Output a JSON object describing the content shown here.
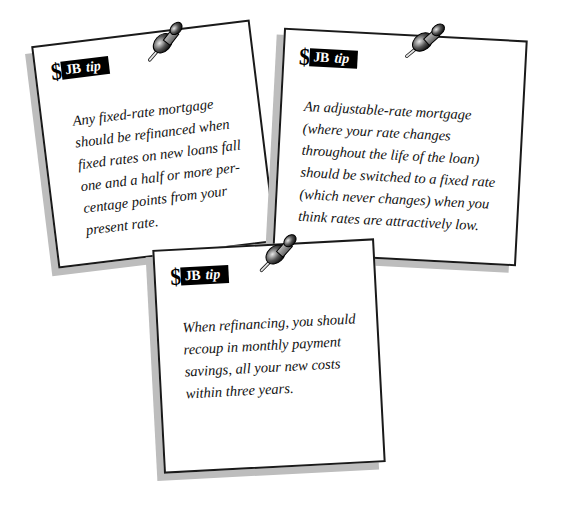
{
  "notes": [
    {
      "badge": {
        "symbol": "$",
        "brand": "JB",
        "label": "tip"
      },
      "text": "Any fixed-rate mortgage should be refinanced when fixed rates on new loans fall one and a half or more percentage points from your present rate.",
      "lines": [
        "Any fixed-rate mortgage",
        "should be refinanced when",
        "fixed rates on new loans fall",
        "one and a half or more per-",
        "centage points from your",
        "present rate."
      ],
      "icon": "pushpin-icon"
    },
    {
      "badge": {
        "symbol": "$",
        "brand": "JB",
        "label": "tip"
      },
      "text": "An adjustable-rate mortgage (where your rate changes throughout the life of the loan) should be switched to a fixed rate (which never changes) when you think rates are attractively low.",
      "lines": [
        "An adjustable-rate mortgage",
        "(where your rate changes",
        "throughout the life of the loan)",
        "should be switched to a fixed rate",
        "(which never changes) when you",
        "think rates are attractively low."
      ],
      "icon": "pushpin-icon"
    },
    {
      "badge": {
        "symbol": "$",
        "brand": "JB",
        "label": "tip"
      },
      "text": "When refinancing, you should recoup in monthly payment savings, all your new costs within three years.",
      "lines": [
        "When refinancing, you should",
        "recoup in monthly payment",
        "savings, all your new costs",
        "within three years."
      ],
      "icon": "pushpin-icon"
    }
  ],
  "colors": {
    "ink": "#000000",
    "paper": "#ffffff",
    "shadow": "#bdbdbd"
  }
}
